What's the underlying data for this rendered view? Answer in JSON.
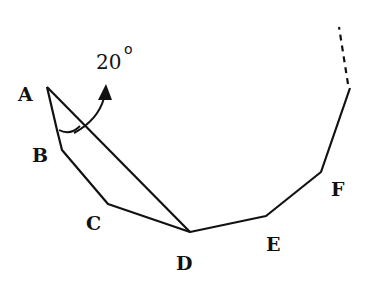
{
  "diagram": {
    "labels": {
      "A": "A",
      "B": "B",
      "C": "C",
      "D": "D",
      "E": "E",
      "F": "F"
    },
    "angle": {
      "value": "20",
      "unit": "o"
    },
    "colors": {
      "stroke": "#111111",
      "background": "#ffffff"
    }
  }
}
